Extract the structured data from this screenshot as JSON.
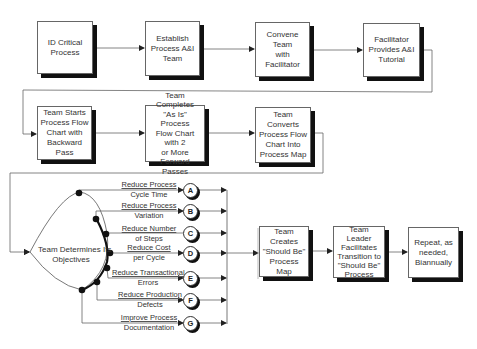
{
  "row1": [
    {
      "id": "id-critical-process",
      "lines": [
        "ID Critical",
        "Process"
      ]
    },
    {
      "id": "establish-team",
      "lines": [
        "Establish",
        "Process A&I",
        "Team"
      ]
    },
    {
      "id": "convene-team",
      "lines": [
        "Convene Team",
        "with Facilitator"
      ]
    },
    {
      "id": "facilitator-tutorial",
      "lines": [
        "Facilitator",
        "Provides A&I",
        "Tutorial"
      ]
    }
  ],
  "row2": [
    {
      "id": "backward-pass",
      "lines": [
        "Team Starts",
        "Process Flow",
        "Chart with",
        "Backward Pass"
      ]
    },
    {
      "id": "as-is-chart",
      "lines": [
        "Team  Completes",
        "\"As Is\" Process",
        "Flow Chart with 2",
        "or More  Forward",
        "Passes"
      ]
    },
    {
      "id": "convert-map",
      "lines": [
        "Team Converts",
        "Process Flow",
        "Chart Into",
        "Process Map"
      ]
    }
  ],
  "objectives": {
    "title_lines": [
      "Team Determines Its",
      "Objectives"
    ],
    "branches": [
      {
        "letter": "A",
        "line1": "Reduce Process",
        "line2": "Cycle Time"
      },
      {
        "letter": "B",
        "line1": "Reduce Process",
        "line2": "Variation"
      },
      {
        "letter": "C",
        "line1": "Reduce Number",
        "line2": "of Steps"
      },
      {
        "letter": "D",
        "line1": "Reduce Cost",
        "line2": "per Cycle"
      },
      {
        "letter": "E",
        "line1": "Reduce Transactional",
        "line2": "Errors"
      },
      {
        "letter": "F",
        "line1": "Reduce Production",
        "line2": "Defects"
      },
      {
        "letter": "G",
        "line1": "Improve Process",
        "line2": "Documentation"
      }
    ]
  },
  "row3": [
    {
      "id": "should-be-map",
      "lines": [
        "Team Creates",
        "\"Should Be\"",
        "Process Map"
      ]
    },
    {
      "id": "leader-transition",
      "lines": [
        "Team Leader",
        "Facilitates",
        "Transition to",
        "\"Should Be\"",
        "Process"
      ]
    },
    {
      "id": "repeat",
      "lines": [
        "Repeat, as",
        "needed,",
        "Biannually"
      ]
    }
  ]
}
